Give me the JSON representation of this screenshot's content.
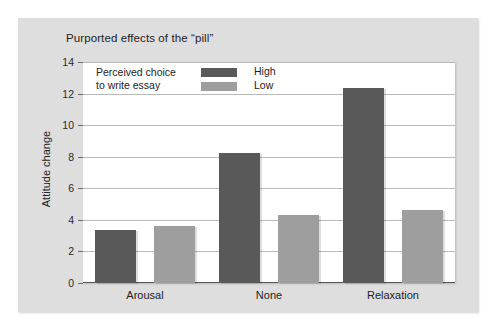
{
  "chart_data": {
    "type": "bar",
    "title": "Purported effects of the “pill”",
    "xlabel": "",
    "ylabel": "Attitude change",
    "ylim": [
      0,
      14
    ],
    "yticks": [
      0,
      2,
      4,
      6,
      8,
      10,
      12,
      14
    ],
    "ytick_labels": [
      "0",
      "2",
      "4",
      "6",
      "8",
      "10",
      "12",
      "14"
    ],
    "grid": true,
    "legend_position": "upper-left-inside",
    "legend_title": "Perceived choice\nto write essay",
    "legend_title_line1": "Perceived choice",
    "legend_title_line2": "to write essay",
    "categories": [
      "Arousal",
      "None",
      "Relaxation"
    ],
    "series": [
      {
        "name": "High",
        "color": "#595959",
        "values": [
          3.35,
          8.25,
          12.35
        ]
      },
      {
        "name": "Low",
        "color": "#9e9e9e",
        "values": [
          3.6,
          4.3,
          4.6
        ]
      }
    ]
  },
  "colors": {
    "panel_background": "#dedede",
    "plot_background": "#ffffff",
    "gridline": "#b9b9b9",
    "axis": "#555555",
    "text": "#232323",
    "series_high": "#595959",
    "series_low": "#9e9e9e"
  }
}
